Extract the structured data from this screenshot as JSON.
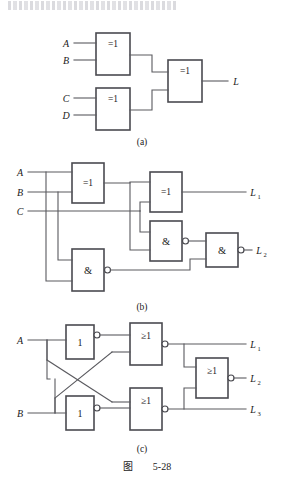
{
  "figure": {
    "caption_prefix": "图",
    "caption_number": "5-28",
    "top_fragment": ""
  },
  "subfigures": [
    {
      "id": "a",
      "label": "(a)",
      "inputs": [
        "A",
        "B",
        "C",
        "D"
      ],
      "outputs": [
        "L"
      ],
      "gates": [
        {
          "name": "gate-a-xor1",
          "symbol": "=1",
          "type": "xor",
          "inverted_output": false
        },
        {
          "name": "gate-a-xor2",
          "symbol": "=1",
          "type": "xor",
          "inverted_output": false
        },
        {
          "name": "gate-a-xor3",
          "symbol": "=1",
          "type": "xor",
          "inverted_output": false
        }
      ]
    },
    {
      "id": "b",
      "label": "(b)",
      "inputs": [
        "A",
        "B",
        "C"
      ],
      "outputs": [
        "L",
        "L"
      ],
      "output_subs": [
        "1",
        "2"
      ],
      "gates": [
        {
          "name": "gate-b-xor1",
          "symbol": "=1",
          "type": "xor",
          "inverted_output": false
        },
        {
          "name": "gate-b-xor2",
          "symbol": "=1",
          "type": "xor",
          "inverted_output": false
        },
        {
          "name": "gate-b-nand1",
          "symbol": "&",
          "type": "nand",
          "inverted_output": true
        },
        {
          "name": "gate-b-nand2",
          "symbol": "&",
          "type": "nand",
          "inverted_output": true
        },
        {
          "name": "gate-b-nand3",
          "symbol": "&",
          "type": "nand",
          "inverted_output": true
        }
      ]
    },
    {
      "id": "c",
      "label": "(c)",
      "inputs": [
        "A",
        "B"
      ],
      "outputs": [
        "L",
        "L",
        "L"
      ],
      "output_subs": [
        "1",
        "2",
        "3"
      ],
      "gates": [
        {
          "name": "gate-c-not1",
          "symbol": "1",
          "type": "not",
          "inverted_output": true
        },
        {
          "name": "gate-c-not2",
          "symbol": "1",
          "type": "not",
          "inverted_output": true
        },
        {
          "name": "gate-c-nor1",
          "symbol": "≥1",
          "type": "nor",
          "inverted_output": true
        },
        {
          "name": "gate-c-nor2",
          "symbol": "≥1",
          "type": "nor",
          "inverted_output": true
        },
        {
          "name": "gate-c-nor3",
          "symbol": "≥1",
          "type": "nor",
          "inverted_output": true
        }
      ]
    }
  ],
  "colors": {
    "line": "#5a5a5f",
    "gate_border": "#4a4a50",
    "text": "#1a1a1a",
    "background": "#ffffff"
  }
}
